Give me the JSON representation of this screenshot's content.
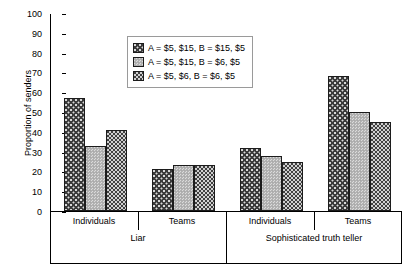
{
  "chart_data": {
    "type": "bar",
    "title": "",
    "xlabel": "",
    "ylabel": "Proportion of senders",
    "ylim": [
      0,
      100
    ],
    "ytick_step": 10,
    "yticks": [
      100,
      90,
      80,
      70,
      60,
      50,
      40,
      30,
      20,
      10,
      0
    ],
    "grid": false,
    "legend_position": "upper-center",
    "group_labels_level1": [
      "Individuals",
      "Teams",
      "Individuals",
      "Teams"
    ],
    "group_labels_level2": [
      "Liar",
      "Sophisticated truth teller"
    ],
    "categories": [
      "Liar - Individuals",
      "Liar - Teams",
      "Sophisticated truth teller - Individuals",
      "Sophisticated truth teller - Teams"
    ],
    "series": [
      {
        "name": "A = $5, $15, B = $15, $5",
        "pattern": "dark-dotted",
        "color": "#3a3a3a",
        "values": [
          57,
          21,
          32,
          68
        ]
      },
      {
        "name": "A = $5, $15, B = $6, $5",
        "pattern": "light-gray-fine",
        "color": "#b5b5b5",
        "values": [
          33,
          23,
          28,
          50
        ]
      },
      {
        "name": "A = $5, $6, B = $6, $5",
        "pattern": "dark-checker",
        "color": "#3f3f3f",
        "values": [
          41,
          23,
          25,
          45
        ]
      }
    ]
  },
  "legend": {
    "items": [
      {
        "label": "A = $5, $15, B = $15, $5"
      },
      {
        "label": "A = $5, $15, B = $6, $5"
      },
      {
        "label": "A = $5, $6, B = $6, $5"
      }
    ]
  },
  "axis": {
    "y_title": "Proportion of senders",
    "y_labels": [
      "100",
      "90",
      "80",
      "70",
      "60",
      "50",
      "40",
      "30",
      "20",
      "10",
      "0"
    ],
    "x_level1": [
      "Individuals",
      "Teams",
      "Individuals",
      "Teams"
    ],
    "x_level2": [
      "Liar",
      "Sophisticated truth teller"
    ]
  }
}
